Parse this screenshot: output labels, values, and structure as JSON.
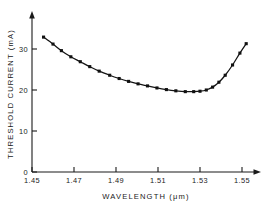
{
  "chart_data": {
    "type": "line",
    "title": "",
    "subtitle": "",
    "xlabel": "WAVELENGTH (μm)",
    "ylabel": "THRESHOLD CURRENT (mA)",
    "xlim": [
      1.45,
      1.555
    ],
    "ylim": [
      0,
      36
    ],
    "grid": false,
    "legend": null,
    "xticks": [
      1.45,
      1.47,
      1.49,
      1.51,
      1.53,
      1.55
    ],
    "xtick_labels": [
      "1.45",
      "1.47",
      "1.49",
      "1.51",
      "1.53",
      "1.55"
    ],
    "yticks": [
      0,
      10,
      20,
      30
    ],
    "ytick_labels": [
      "0",
      "10",
      "20",
      "30"
    ],
    "marker": "filled-square",
    "series": [
      {
        "name": "threshold current",
        "x": [
          1.4555,
          1.46,
          1.464,
          1.4685,
          1.473,
          1.4775,
          1.482,
          1.487,
          1.4915,
          1.496,
          1.5005,
          1.505,
          1.5095,
          1.514,
          1.5185,
          1.523,
          1.527,
          1.53,
          1.533,
          1.536,
          1.539,
          1.542,
          1.5455,
          1.549,
          1.552
        ],
        "y": [
          32.9,
          31.2,
          29.6,
          28.1,
          26.9,
          25.7,
          24.6,
          23.6,
          22.8,
          22.1,
          21.5,
          21.0,
          20.5,
          20.1,
          19.8,
          19.6,
          19.6,
          19.7,
          20.0,
          20.7,
          21.9,
          23.6,
          26.1,
          29.0,
          31.3
        ]
      }
    ],
    "minimum": {
      "x": 1.525,
      "y": 19.6
    }
  },
  "axis_style": {
    "axis_color": "#1a1a1a",
    "curve_color": "#141414",
    "marker_color": "#111111",
    "background": "#ffffff"
  }
}
